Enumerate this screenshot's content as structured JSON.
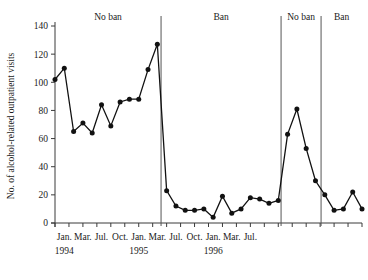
{
  "chart_data": {
    "type": "line",
    "title": "",
    "xlabel": "",
    "ylabel": "No. of alcohol-related outpatient visits",
    "ylim": [
      0,
      140
    ],
    "yticks": [
      0,
      20,
      40,
      60,
      80,
      100,
      120,
      140
    ],
    "grid": false,
    "legend_position": "none",
    "marker": "filled-circle",
    "xticks": [
      {
        "index": 1,
        "label": "Jan.",
        "year": "1994"
      },
      {
        "index": 3,
        "label": "Mar.",
        "year": ""
      },
      {
        "index": 5,
        "label": "Jul.",
        "year": ""
      },
      {
        "index": 7,
        "label": "Oct.",
        "year": ""
      },
      {
        "index": 9,
        "label": "Jan.",
        "year": "1995"
      },
      {
        "index": 11,
        "label": "Mar.",
        "year": ""
      },
      {
        "index": 13,
        "label": "Jul.",
        "year": ""
      },
      {
        "index": 15,
        "label": "Oct.",
        "year": ""
      },
      {
        "index": 17,
        "label": "Jan.",
        "year": "1996"
      },
      {
        "index": 19,
        "label": "Mar.",
        "year": ""
      },
      {
        "index": 21,
        "label": "Jul.",
        "year": ""
      }
    ],
    "x": [
      0,
      1,
      2,
      3,
      4,
      5,
      6,
      7,
      8,
      9,
      10,
      11,
      12,
      13,
      14,
      15,
      16,
      17,
      18,
      19,
      20,
      21,
      22,
      23,
      24,
      25,
      26,
      27,
      28,
      29,
      30,
      31
    ],
    "values": [
      102,
      110,
      65,
      71,
      64,
      84,
      69,
      86,
      88,
      88,
      109,
      127,
      23,
      12,
      9,
      9,
      10,
      4,
      19,
      7,
      10,
      18,
      17,
      14,
      16,
      63,
      81,
      53,
      30,
      20,
      9,
      10
    ],
    "series": [
      {
        "name": "Alcohol-related outpatient visits",
        "values": [
          102,
          110,
          65,
          71,
          64,
          84,
          69,
          86,
          88,
          88,
          109,
          127,
          23,
          12,
          9,
          9,
          10,
          4,
          19,
          7,
          10,
          18,
          17,
          14,
          16,
          63,
          81,
          53,
          30,
          20,
          9,
          10
        ]
      }
    ],
    "extra_tail": {
      "note": "final rise and fall",
      "values": [
        22,
        10
      ]
    },
    "annotations": [
      {
        "label": "No ban",
        "start_index": 0,
        "end_index": 11.4
      },
      {
        "label": "Ban",
        "start_index": 11.4,
        "end_index": 24.3
      },
      {
        "label": "No ban",
        "start_index": 24.3,
        "end_index": 28.6
      },
      {
        "label": "Ban",
        "start_index": 28.6,
        "end_index": 33
      }
    ],
    "dividers_at_index": [
      11.4,
      24.3,
      28.6
    ],
    "colors": {
      "line": "#111111",
      "marker": "#111111",
      "axis": "#3a3a3a",
      "divider": "#555555",
      "background": "#ffffff"
    }
  }
}
